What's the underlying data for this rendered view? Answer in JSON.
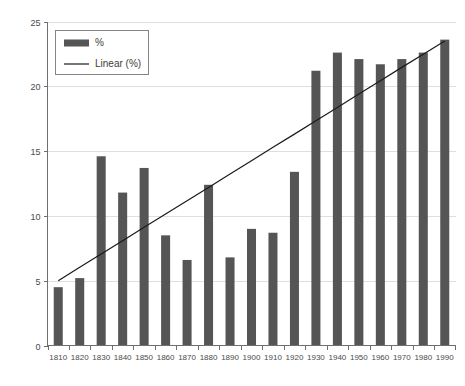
{
  "chart_data": {
    "type": "bar",
    "title": "",
    "subtitle": "",
    "xlabel": "",
    "ylabel": "",
    "categories": [
      "1810",
      "1820",
      "1830",
      "1840",
      "1850",
      "1860",
      "1870",
      "1880",
      "1890",
      "1900",
      "1910",
      "1920",
      "1930",
      "1940",
      "1950",
      "1960",
      "1970",
      "1980",
      "1990"
    ],
    "values": [
      4.5,
      5.2,
      14.6,
      11.8,
      13.7,
      8.5,
      6.6,
      12.4,
      6.8,
      9.0,
      8.7,
      13.4,
      21.2,
      22.6,
      22.1,
      21.7,
      22.1,
      22.6,
      23.6
    ],
    "series": [
      {
        "name": "%",
        "type": "bar",
        "values": [
          4.5,
          5.2,
          14.6,
          11.8,
          13.7,
          8.5,
          6.6,
          12.4,
          6.8,
          9.0,
          8.7,
          13.4,
          21.2,
          22.6,
          22.1,
          21.7,
          22.1,
          22.6,
          23.6
        ]
      },
      {
        "name": "Linear (%)",
        "type": "line",
        "values": [
          5.0,
          6.03,
          7.06,
          8.09,
          9.12,
          10.14,
          11.17,
          12.2,
          13.23,
          14.26,
          15.29,
          16.31,
          17.34,
          18.37,
          19.4,
          20.43,
          21.46,
          22.48,
          23.5
        ]
      }
    ],
    "ylim": [
      0,
      25
    ],
    "yticks": [
      0,
      5,
      10,
      15,
      20,
      25
    ],
    "ytick_labels": [
      "0",
      "5",
      "10",
      "15",
      "20",
      "25"
    ],
    "xtick_labels": [
      "1810",
      "1820",
      "1830",
      "1840",
      "1850",
      "1860",
      "1870",
      "1880",
      "1890",
      "1900",
      "1910",
      "1920",
      "1930",
      "1940",
      "1950",
      "1960",
      "1970",
      "1980",
      "1990"
    ],
    "grid": true,
    "grid_axis": "y",
    "legend": {
      "position": "top-left",
      "entries": [
        {
          "label": "%",
          "marker": "bar-swatch",
          "color": "#555555"
        },
        {
          "label": "Linear (%)",
          "marker": "line",
          "color": "#1a1a1a"
        }
      ]
    },
    "colors": {
      "bar": "#555555",
      "trend": "#1a1a1a",
      "grid": "#dfdfdf",
      "axis": "#6f6f6f",
      "background": "#ffffff",
      "tick_text": "#4a4a4a"
    }
  }
}
